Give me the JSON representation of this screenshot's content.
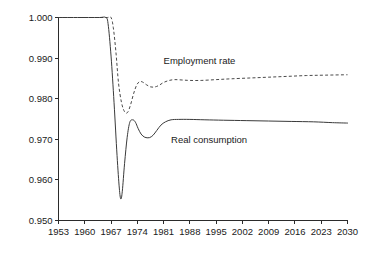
{
  "chart_data": {
    "type": "line",
    "title": "",
    "subtitle": "",
    "xlabel": "",
    "ylabel": "",
    "xlim": [
      1953,
      2030
    ],
    "ylim": [
      0.95,
      1.0
    ],
    "grid": false,
    "legend_position": "inline-annotation",
    "x_ticks": [
      "1953",
      "1960",
      "1967",
      "1974",
      "1981",
      "1988",
      "1995",
      "2002",
      "2009",
      "2016",
      "2023",
      "2030"
    ],
    "y_ticks": [
      "1.000",
      "0.990",
      "0.980",
      "0.970",
      "0.960",
      "0.950"
    ],
    "annotations": [
      {
        "text": "Employment rate",
        "x": 1981,
        "y": 0.9885
      },
      {
        "text": "Real consumption",
        "x": 1983,
        "y": 0.969
      }
    ],
    "series": [
      {
        "name": "Employment rate",
        "style": "dashed",
        "color": "#4a4a4a",
        "x": [
          1953,
          1957,
          1961,
          1964,
          1966,
          1967,
          1967.6,
          1968.3,
          1969,
          1969.8,
          1970.6,
          1971.4,
          1972.2,
          1973,
          1973.8,
          1974.6,
          1975.4,
          1976.5,
          1977.6,
          1978.7,
          1979.8,
          1981,
          1982.5,
          1984,
          1986,
          1988,
          1991,
          1995,
          1999,
          2004,
          2009,
          2014,
          2019,
          2024,
          2030
        ],
        "y": [
          1.0,
          1.0,
          1.0,
          1.0,
          1.0,
          1.0,
          0.9975,
          0.9915,
          0.9838,
          0.979,
          0.9768,
          0.9766,
          0.9785,
          0.9812,
          0.9833,
          0.9842,
          0.9841,
          0.9834,
          0.9829,
          0.9829,
          0.9833,
          0.984,
          0.9845,
          0.9847,
          0.9846,
          0.9845,
          0.9845,
          0.9847,
          0.9849,
          0.9851,
          0.9853,
          0.9855,
          0.9857,
          0.9858,
          0.9859
        ]
      },
      {
        "name": "Real consumption",
        "style": "solid",
        "color": "#3a3a3a",
        "x": [
          1953,
          1957,
          1961,
          1964,
          1965.6,
          1966.2,
          1967,
          1967.8,
          1968.6,
          1969.2,
          1969.6,
          1970,
          1970.6,
          1971.3,
          1972,
          1972.8,
          1973.5,
          1974.2,
          1975,
          1976,
          1977.2,
          1978.2,
          1979.2,
          1980.3,
          1981.5,
          1983,
          1985,
          1988,
          1992,
          1997,
          2003,
          2009,
          2015,
          2021,
          2026,
          2030
        ],
        "y": [
          1.0,
          1.0,
          1.0,
          1.0,
          1.0,
          0.9985,
          0.9905,
          0.979,
          0.966,
          0.958,
          0.9553,
          0.9572,
          0.964,
          0.9705,
          0.9742,
          0.9748,
          0.9742,
          0.9727,
          0.9713,
          0.9705,
          0.9704,
          0.971,
          0.9722,
          0.9735,
          0.9743,
          0.9748,
          0.9749,
          0.9749,
          0.9748,
          0.9747,
          0.9746,
          0.9745,
          0.9744,
          0.9743,
          0.9741,
          0.974
        ]
      }
    ]
  }
}
